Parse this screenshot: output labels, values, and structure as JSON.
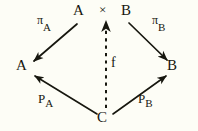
{
  "figure": {
    "kind": "commutative-diagram",
    "background_color": "#fdfdf6",
    "ink_color": "#17170f"
  },
  "top_expression": {
    "left_factor": "A",
    "operator": "×",
    "right_factor": "B"
  },
  "nodes": [
    {
      "id": "product",
      "label": "A",
      "x": 78,
      "y": 10
    },
    {
      "id": "product-times",
      "label": "×",
      "x": 104,
      "y": 10
    },
    {
      "id": "product-right",
      "label": "B",
      "x": 126,
      "y": 10
    },
    {
      "id": "object-a",
      "label": "A",
      "x": 22,
      "y": 66
    },
    {
      "id": "object-b",
      "label": "B",
      "x": 170,
      "y": 66
    },
    {
      "id": "object-c",
      "label": "C",
      "x": 101,
      "y": 117
    }
  ],
  "edges": [
    {
      "id": "pi-a",
      "from": "product",
      "to": "object-a",
      "style": "solid",
      "label_base": "π",
      "label_sub": "A"
    },
    {
      "id": "pi-b",
      "from": "product",
      "to": "object-b",
      "style": "solid",
      "label_base": "π",
      "label_sub": "B"
    },
    {
      "id": "p-a",
      "from": "object-c",
      "to": "object-a",
      "style": "solid",
      "label_base": "P",
      "label_sub": "A"
    },
    {
      "id": "p-b",
      "from": "object-c",
      "to": "object-b",
      "style": "solid",
      "label_base": "P",
      "label_sub": "B"
    },
    {
      "id": "f",
      "from": "object-c",
      "to": "product",
      "style": "dashed",
      "label_base": "f",
      "label_sub": ""
    }
  ],
  "labels": {
    "pi_a_base": "π",
    "pi_a_sub": "A",
    "pi_b_base": "π",
    "pi_b_sub": "B",
    "p_a_base": "P",
    "p_a_sub": "A",
    "p_b_base": "P",
    "p_b_sub": "B",
    "f": "f"
  }
}
